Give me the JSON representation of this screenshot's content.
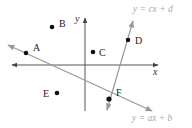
{
  "diagram": {
    "type": "coordinate-plane-with-lines",
    "axes": {
      "x_label": "x",
      "y_label": "y",
      "origin_px": [
        85,
        65
      ],
      "color": "#555555"
    },
    "lines": [
      {
        "id": "line-ab",
        "equation": "y = ax + b",
        "from_px": [
          8,
          45
        ],
        "to_px": [
          152,
          111
        ],
        "label_px": [
          133,
          121
        ],
        "color": "#999999"
      },
      {
        "id": "line-cd",
        "equation": "y = cx + d",
        "from_px": [
          107,
          110
        ],
        "to_px": [
          133,
          21
        ],
        "label_px": [
          133,
          13
        ],
        "color": "#999999"
      }
    ],
    "points": [
      {
        "name": "A",
        "px": [
          26,
          53
        ],
        "label_px": [
          33,
          50
        ]
      },
      {
        "name": "B",
        "px": [
          52,
          27
        ],
        "label_px": [
          59,
          26
        ]
      },
      {
        "name": "C",
        "px": [
          93,
          52
        ],
        "label_px": [
          99,
          56
        ]
      },
      {
        "name": "D",
        "px": [
          128,
          40
        ],
        "label_px": [
          135,
          44
        ]
      },
      {
        "name": "E",
        "px": [
          57,
          93
        ],
        "label_px": [
          44,
          97
        ]
      },
      {
        "name": "F",
        "px": [
          109,
          99
        ],
        "label_px": [
          116,
          96
        ]
      }
    ],
    "point_color": "#111111"
  }
}
